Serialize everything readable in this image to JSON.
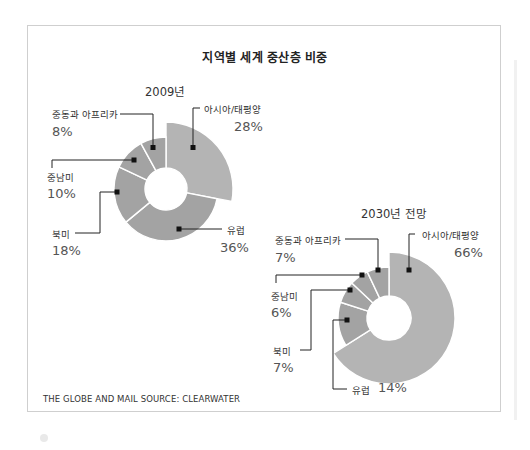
{
  "chart_data": [
    {
      "type": "pie",
      "subtype": "donut",
      "title": "지역별 세계 중산층 비중",
      "subtitle": "2009년",
      "categories": [
        "아시아/태평양",
        "유럽",
        "북미",
        "중남미",
        "중동과 아프리카"
      ],
      "values": [
        28,
        36,
        18,
        10,
        8
      ],
      "unit": "%",
      "highlighted": "아시아/태평양",
      "colors": {
        "highlight": "#b4b4b4",
        "other": "#a3a3a3",
        "separator": "#ffffff"
      }
    },
    {
      "type": "pie",
      "subtype": "donut",
      "title": "지역별 세계 중산층 비중",
      "subtitle": "2030년 전망",
      "categories": [
        "아시아/태평양",
        "유럽",
        "북미",
        "중남미",
        "중동과 아프리카"
      ],
      "values": [
        66,
        14,
        7,
        6,
        7
      ],
      "unit": "%",
      "highlighted": "아시아/태평양",
      "colors": {
        "highlight": "#b4b4b4",
        "other": "#a3a3a3",
        "separator": "#ffffff"
      }
    }
  ],
  "title": "지역별 세계 중산층 비중",
  "chart2009": {
    "subtitle": "2009년",
    "labels": {
      "asia": {
        "name": "아시아/태평양",
        "pct": "28%"
      },
      "europe": {
        "name": "유럽",
        "pct": "36%"
      },
      "namerica": {
        "name": "북미",
        "pct": "18%"
      },
      "latam": {
        "name": "중남미",
        "pct": "10%"
      },
      "mea": {
        "name": "중동과 아프리카",
        "pct": "8%"
      }
    }
  },
  "chart2030": {
    "subtitle": "2030년 전망",
    "labels": {
      "asia": {
        "name": "아시아/태평양",
        "pct": "66%"
      },
      "europe": {
        "name": "유럽",
        "pct": "14%"
      },
      "namerica": {
        "name": "북미",
        "pct": "7%"
      },
      "latam": {
        "name": "중남미",
        "pct": "6%"
      },
      "mea": {
        "name": "중동과 아프리카",
        "pct": "7%"
      }
    }
  },
  "footer": "THE GLOBE AND MAIL SOURCE: CLEARWATER",
  "colors": {
    "frame_border": "#cfcfcf",
    "slice_highlight": "#b4b4b4",
    "slice_other": "#a3a3a3",
    "leader": "#222222"
  }
}
